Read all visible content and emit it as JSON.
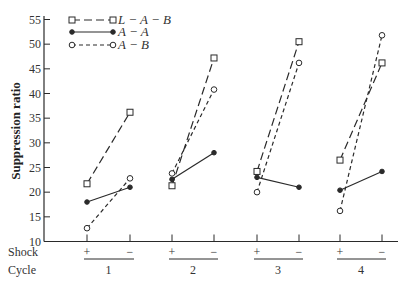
{
  "chart_data": {
    "type": "line",
    "title": "",
    "xlabel": "",
    "ylabel": "Suppression ratio",
    "ylim": [
      10,
      55
    ],
    "yticks": [
      10,
      15,
      20,
      25,
      30,
      35,
      40,
      45,
      50,
      55
    ],
    "grid": false,
    "legend_position": "top-left",
    "x_rows": [
      {
        "label": "Shock",
        "ticks": [
          "+",
          "−",
          "+",
          "−",
          "+",
          "−",
          "+",
          "−"
        ]
      },
      {
        "label": "Cycle",
        "groups": [
          "1",
          "2",
          "3",
          "4"
        ]
      }
    ],
    "categories": [
      "1+",
      "1−",
      "2+",
      "2−",
      "3+",
      "3−",
      "4+",
      "4−"
    ],
    "series": [
      {
        "name": "L − A − B",
        "marker": "square-open",
        "line": "long-dash",
        "values": [
          21.7,
          36.2,
          21.3,
          47.2,
          24.2,
          50.5,
          26.5,
          46.2
        ]
      },
      {
        "name": "A − A",
        "marker": "circle-filled",
        "line": "solid",
        "values": [
          18.0,
          21.0,
          22.6,
          28.0,
          23.0,
          21.0,
          20.4,
          24.2
        ]
      },
      {
        "name": "A − B",
        "marker": "circle-open",
        "line": "short-dash",
        "values": [
          12.7,
          22.8,
          23.8,
          40.8,
          20.0,
          46.2,
          16.2,
          51.8
        ]
      }
    ],
    "note": "Lines connect only + and − within each cycle"
  }
}
